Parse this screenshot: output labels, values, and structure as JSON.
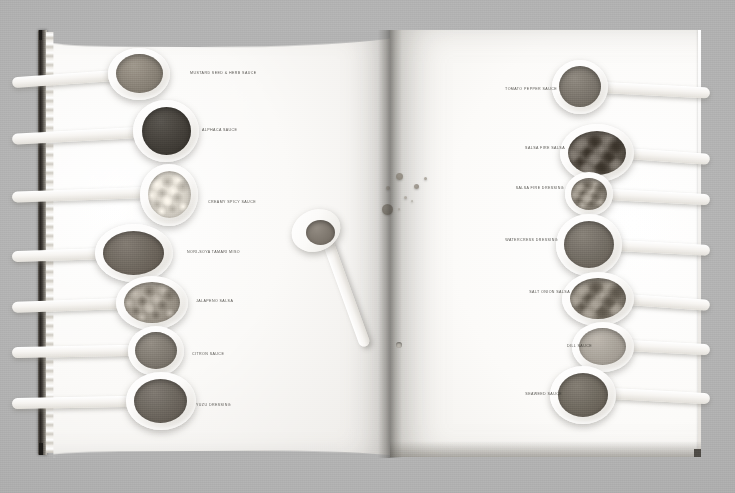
{
  "scene": {
    "type": "photograph",
    "subject": "open cookbook spread photographed on a grey surface",
    "description": "Double-page spread of a food book showing white ceramic spoons each filled with a different sauce, dressing or relish, labelled in small caps; a single spoon lies diagonally across the gutter and sauce droplets are splashed on the right-hand page."
  },
  "colors": {
    "background": "#b4b4b4",
    "page_white": "#fbfaf8",
    "page_shadow": "#e2e0dc",
    "spine_dark": "#282522",
    "label_text": "#3a3833",
    "gutter_shadow": "#5a5852"
  },
  "left_page": {
    "spoons": [
      {
        "label": "MUSTARD SEED & HERB SAUCE",
        "sauce_color": "#8a8378",
        "texture": "smooth",
        "bowl": {
          "x": 108,
          "y": 48,
          "w": 62,
          "h": 52
        },
        "sauce": {
          "x": 116,
          "y": 54,
          "w": 47,
          "h": 39
        },
        "handle": {
          "x": 12,
          "y": 70,
          "w": 104,
          "h": 11,
          "rotate": -4
        },
        "label_pos": {
          "x": 190,
          "y": 71
        }
      },
      {
        "label": "ALPHACA SAUCE",
        "sauce_color": "#44403a",
        "texture": "dark-smooth",
        "bowl": {
          "x": 133,
          "y": 100,
          "w": 66,
          "h": 62
        },
        "sauce": {
          "x": 142,
          "y": 107,
          "w": 49,
          "h": 48,
          "radius": 50
        },
        "handle": {
          "x": 12,
          "y": 127,
          "w": 128,
          "h": 11,
          "rotate": -3
        },
        "label_pos": {
          "x": 202,
          "y": 128
        }
      },
      {
        "label": "CREAMY SPICY SAUCE",
        "sauce_color": "#d6d1c7",
        "texture": "chunky-pale",
        "bowl": {
          "x": 140,
          "y": 164,
          "w": 58,
          "h": 62
        },
        "sauce": {
          "x": 148,
          "y": 171,
          "w": 43,
          "h": 47
        },
        "handle": {
          "x": 12,
          "y": 187,
          "w": 134,
          "h": 11,
          "rotate": -2
        },
        "label_pos": {
          "x": 208,
          "y": 200
        }
      },
      {
        "label": "NORI-SOYA TAMARI MISO",
        "sauce_color": "#6e675e",
        "texture": "smooth",
        "bowl": {
          "x": 95,
          "y": 224,
          "w": 78,
          "h": 58
        },
        "sauce": {
          "x": 103,
          "y": 231,
          "w": 61,
          "h": 44
        },
        "handle": {
          "x": 12,
          "y": 248,
          "w": 92,
          "h": 11,
          "rotate": -2
        },
        "label_pos": {
          "x": 187,
          "y": 250
        }
      },
      {
        "label": "JALAPENO SALSA",
        "sauce_color": "#9c958a",
        "texture": "chunky",
        "bowl": {
          "x": 116,
          "y": 276,
          "w": 72,
          "h": 54
        },
        "sauce": {
          "x": 124,
          "y": 282,
          "w": 56,
          "h": 41
        },
        "handle": {
          "x": 12,
          "y": 298,
          "w": 110,
          "h": 11,
          "rotate": -2
        },
        "label_pos": {
          "x": 196,
          "y": 299
        }
      },
      {
        "label": "CITRON SAUCE",
        "sauce_color": "#7f7970",
        "texture": "smooth",
        "bowl": {
          "x": 128,
          "y": 326,
          "w": 56,
          "h": 50
        },
        "sauce": {
          "x": 135,
          "y": 332,
          "w": 42,
          "h": 37
        },
        "handle": {
          "x": 12,
          "y": 345,
          "w": 120,
          "h": 11,
          "rotate": -1
        },
        "label_pos": {
          "x": 192,
          "y": 352
        }
      },
      {
        "label": "YUZU DRESSING",
        "sauce_color": "#6b655d",
        "texture": "smooth",
        "bowl": {
          "x": 126,
          "y": 372,
          "w": 70,
          "h": 58
        },
        "sauce": {
          "x": 134,
          "y": 379,
          "w": 53,
          "h": 44
        },
        "handle": {
          "x": 12,
          "y": 396,
          "w": 118,
          "h": 11,
          "rotate": -1
        },
        "label_pos": {
          "x": 196,
          "y": 403
        }
      }
    ]
  },
  "right_page": {
    "spoons": [
      {
        "label": "TOMATO PEPPER SAUCE",
        "sauce_color": "#7b756c",
        "texture": "smooth",
        "bowl": {
          "x": 552,
          "y": 60,
          "w": 56,
          "h": 54
        },
        "sauce": {
          "x": 559,
          "y": 66,
          "w": 42,
          "h": 41
        },
        "handle": {
          "x": 602,
          "y": 82,
          "w": 108,
          "h": 11,
          "rotate": 3
        },
        "label_pos": {
          "x": 495,
          "y": 87
        }
      },
      {
        "label": "SALSA FIRE SALSA",
        "sauce_color": "#5d564d",
        "texture": "very-chunky",
        "bowl": {
          "x": 560,
          "y": 124,
          "w": 74,
          "h": 58
        },
        "sauce": {
          "x": 568,
          "y": 131,
          "w": 58,
          "h": 44
        },
        "handle": {
          "x": 626,
          "y": 148,
          "w": 84,
          "h": 11,
          "rotate": 4
        },
        "label_pos": {
          "x": 503,
          "y": 146
        }
      },
      {
        "label": "SALSA FIRE DRESSING",
        "sauce_color": "#8c857a",
        "texture": "chunky",
        "bowl": {
          "x": 565,
          "y": 172,
          "w": 48,
          "h": 44
        },
        "sauce": {
          "x": 571,
          "y": 178,
          "w": 36,
          "h": 32
        },
        "handle": {
          "x": 608,
          "y": 189,
          "w": 102,
          "h": 11,
          "rotate": 3
        },
        "label_pos": {
          "x": 502,
          "y": 186
        }
      },
      {
        "label": "WATERCRESS DRESSING",
        "sauce_color": "#736d64",
        "texture": "smooth",
        "bowl": {
          "x": 556,
          "y": 214,
          "w": 66,
          "h": 62
        },
        "sauce": {
          "x": 564,
          "y": 221,
          "w": 50,
          "h": 47
        },
        "handle": {
          "x": 616,
          "y": 240,
          "w": 94,
          "h": 11,
          "rotate": 3
        },
        "label_pos": {
          "x": 496,
          "y": 238
        }
      },
      {
        "label": "SALT ONION SALSA",
        "sauce_color": "#827b70",
        "texture": "very-chunky",
        "bowl": {
          "x": 562,
          "y": 272,
          "w": 72,
          "h": 54
        },
        "sauce": {
          "x": 570,
          "y": 278,
          "w": 56,
          "h": 41
        },
        "handle": {
          "x": 626,
          "y": 294,
          "w": 84,
          "h": 11,
          "rotate": 4
        },
        "label_pos": {
          "x": 508,
          "y": 290
        }
      },
      {
        "label": "DILL SAUCE",
        "sauce_color": "#a8a299",
        "texture": "smooth-pale",
        "bowl": {
          "x": 572,
          "y": 322,
          "w": 62,
          "h": 50
        },
        "sauce": {
          "x": 579,
          "y": 328,
          "w": 47,
          "h": 37
        },
        "handle": {
          "x": 626,
          "y": 340,
          "w": 84,
          "h": 11,
          "rotate": 3
        },
        "label_pos": {
          "x": 530,
          "y": 344
        }
      },
      {
        "label": "SEAWEED SAUCE",
        "sauce_color": "#6f695f",
        "texture": "smooth",
        "bowl": {
          "x": 550,
          "y": 366,
          "w": 66,
          "h": 58
        },
        "sauce": {
          "x": 558,
          "y": 373,
          "w": 50,
          "h": 44
        },
        "handle": {
          "x": 610,
          "y": 388,
          "w": 100,
          "h": 11,
          "rotate": 3
        },
        "label_pos": {
          "x": 500,
          "y": 392
        }
      }
    ]
  },
  "center_spoon": {
    "name": "bridging-spoon",
    "sauce_color": "#7d766d",
    "description": "spoon lying diagonally across the gutter, handle pierced with a hanging hole"
  },
  "droplets": [
    {
      "x": 396,
      "y": 173,
      "d": 7,
      "color": "#8e887e"
    },
    {
      "x": 386,
      "y": 186,
      "d": 4,
      "color": "#9a948b"
    },
    {
      "x": 414,
      "y": 184,
      "d": 5,
      "color": "#938d84"
    },
    {
      "x": 424,
      "y": 177,
      "d": 3,
      "color": "#a29c93"
    },
    {
      "x": 404,
      "y": 196,
      "d": 3,
      "color": "#a5a098"
    },
    {
      "x": 411,
      "y": 200,
      "d": 2,
      "color": "#adaaa2"
    },
    {
      "x": 382,
      "y": 204,
      "d": 11,
      "color": "#7e786f"
    },
    {
      "x": 398,
      "y": 208,
      "d": 2,
      "color": "#aaa69e"
    }
  ]
}
